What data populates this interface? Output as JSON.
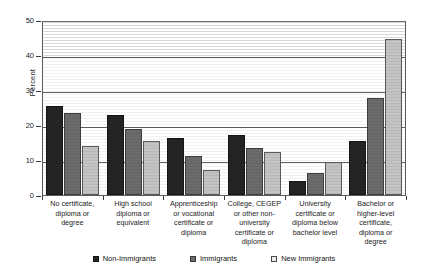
{
  "chart_data": {
    "type": "bar",
    "title": "",
    "subtitle": "",
    "xlabel": "",
    "ylabel": "Percent",
    "ylim": [
      0,
      50
    ],
    "yticks": [
      0,
      10,
      20,
      30,
      40,
      50
    ],
    "ytick_labels": [
      "0",
      "10",
      "20",
      "30",
      "40",
      "50"
    ],
    "grid": true,
    "grid_axis": "y",
    "legend_position": "bottom",
    "categories": [
      "No certificate, diploma or degree",
      "High school diploma or equivalent",
      "Apprenticeship or vocational certificate or diploma",
      "College, CEGEP or other non-university certificate or diploma",
      "University certificate or diploma below bachelor level",
      "Bachelor or higher-level certificate, diploma or degree"
    ],
    "category_lines": [
      [
        "No certificate,",
        "diploma or",
        "degree"
      ],
      [
        "High school",
        "diploma or",
        "equivalent"
      ],
      [
        "Apprenticeship",
        "or vocational",
        "certificate or",
        "diploma"
      ],
      [
        "College, CEGEP",
        "or other non-",
        "university",
        "certificate or",
        "diploma"
      ],
      [
        "University",
        "certificate or",
        "diploma below",
        "bachelor level"
      ],
      [
        "Bachelor or",
        "higher-level",
        "certificate,",
        "diploma or",
        "degree"
      ]
    ],
    "series": [
      {
        "name": "Non-Immigrants",
        "color": "#242424",
        "values": [
          25.4,
          23.0,
          16.2,
          17.1,
          4.1,
          15.5
        ]
      },
      {
        "name": "Immigrants",
        "color": "#6b6b6b",
        "values": [
          23.3,
          19.0,
          11.1,
          13.5,
          6.4,
          27.6
        ]
      },
      {
        "name": "New Immigrants",
        "color": "#c3c3c3",
        "values": [
          13.9,
          15.3,
          7.1,
          12.2,
          9.4,
          44.6
        ]
      }
    ]
  },
  "legend": {
    "items": [
      {
        "label": "Non-Immigrants"
      },
      {
        "label": "Immigrants"
      },
      {
        "label": "New Immigrants"
      }
    ]
  }
}
